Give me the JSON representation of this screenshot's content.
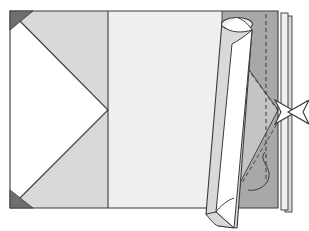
{
  "figure": {
    "type": "origami-fold-diagram",
    "canvas": {
      "width": 309,
      "height": 231
    },
    "background_color": "#ffffff",
    "stroke_color": "#3a3a3a",
    "palette": {
      "paper_white": "#ffffff",
      "paper_light": "#efefef",
      "paper_light_gray": "#d9d9d9",
      "paper_mid_gray": "#c4c4c4",
      "paper_dark_gray": "#a8a8a8",
      "marker_dark": "#6e6e6e",
      "line": "#3a3a3a"
    },
    "sheet": {
      "label": "main-sheet",
      "left": 10,
      "top": 11,
      "right": 292,
      "bottom": 208
    },
    "panels": [
      {
        "name": "left-panel",
        "fill": "#d9d9d9",
        "description": "Left square panel with large white arrow-head notch"
      },
      {
        "name": "center-panel",
        "fill": "#efefef",
        "description": "Center pale panel between vertical crease and right band"
      },
      {
        "name": "right-band",
        "fill": "#a8a8a8",
        "description": "Darker gray band at right edge showing reverse side"
      },
      {
        "name": "inner-triangle",
        "fill": "#c4c4c4",
        "description": "Mid-gray triangular flap inside right band"
      }
    ],
    "creases": [
      {
        "name": "vertical-valley-crease",
        "style": "solid",
        "x": 108
      },
      {
        "name": "right-dashed-crease",
        "style": "dashed",
        "x": 265
      },
      {
        "name": "diagonal-dashed-upper",
        "style": "dashed"
      },
      {
        "name": "diagonal-dashed-lower",
        "style": "dashed"
      }
    ],
    "markers": [
      {
        "name": "corner-marker-top-left",
        "shape": "solid-triangle",
        "fill": "#6e6e6e"
      },
      {
        "name": "corner-marker-bottom-left",
        "shape": "solid-triangle",
        "fill": "#6e6e6e"
      },
      {
        "name": "pleat-arrow",
        "shape": "double-headed-bowtie-arrow",
        "fill": "#ffffff"
      },
      {
        "name": "s-curve-hint",
        "shape": "s-curve-line"
      }
    ],
    "rolled-flap": {
      "name": "rolled-paper-tube",
      "fill_outer": "#d9d9d9",
      "fill_inner": "#ffffff",
      "description": "Curled cylinder of paper rolled up from right edge, overhanging bottom"
    }
  }
}
